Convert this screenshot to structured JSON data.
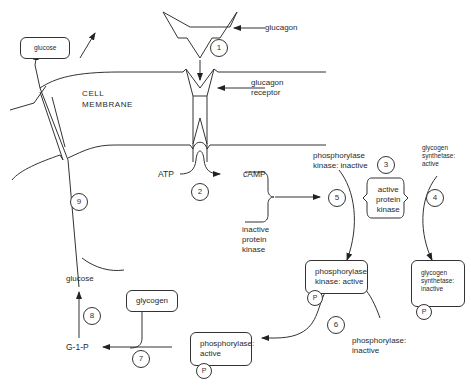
{
  "diagram": {
    "labels": {
      "glucose_top": "glucose",
      "glucagon": "glucagon",
      "glucagon_receptor": "glucagon\nreceptor",
      "cell_membrane": "CELL\nMEMBRANE",
      "atp": "ATP",
      "camp": "cAMP",
      "phosphorylase_kinase_inactive": "phosphorylase\nkinase: inactive",
      "glycogen_synthetase_active": "glycogen\nsynthetase:\nactive",
      "active_protein_kinase": "active\nprotein\nkinase",
      "inactive_protein_kinase": "inactive\nprotein\nkinase",
      "phosphorylase_kinase_active": "phosphorylase\nkinase: active",
      "glycogen_synthetase_inactive": "glycogen\nsynthetase:\ninactive",
      "phosphorylase_inactive": "phosphorylase:\ninactive",
      "phosphorylase_active": "phosphorylase:\nactive",
      "glycogen": "glycogen",
      "glucose_bottom": "glucose",
      "g1p": "G-1-P"
    },
    "phosphate": "P",
    "steps": [
      "1",
      "2",
      "3",
      "4",
      "5",
      "6",
      "7",
      "8",
      "9"
    ],
    "colors": {
      "line": "#333333",
      "text": "#2a2a2a",
      "background": "#ffffff"
    }
  }
}
